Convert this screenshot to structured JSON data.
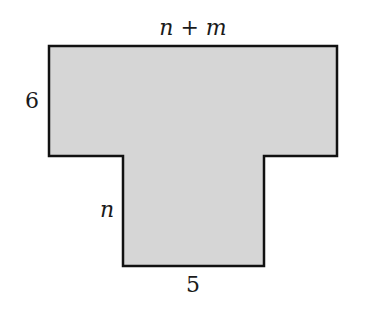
{
  "diagram": {
    "shape": "T-shaped polygon",
    "fill_color": "#d6d6d6",
    "stroke_color": "#111111",
    "labels": {
      "top_width": "n + m",
      "top_height": "6",
      "stem_height": "n",
      "stem_width": "5"
    }
  }
}
